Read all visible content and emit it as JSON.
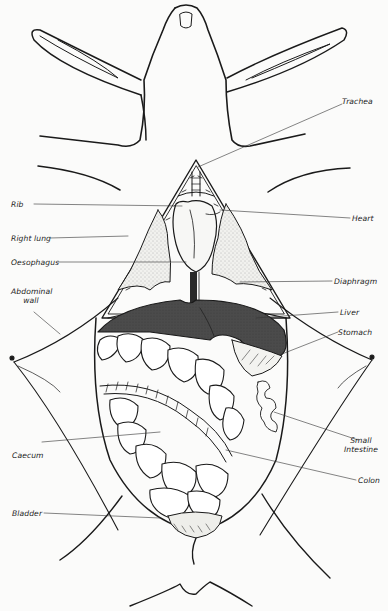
{
  "figure": {
    "colors": {
      "ink": "#1a1a1a",
      "background": "#fbfbfa",
      "liver": "#4a4a4a",
      "lung_fill": "#e6e6e2",
      "oesophagus": "#2a2a2a"
    }
  },
  "labels": {
    "left": [
      {
        "id": "rib",
        "text": "Rib"
      },
      {
        "id": "right_lung",
        "text": "Right lung"
      },
      {
        "id": "oesophagus",
        "text": "Oesophagus"
      },
      {
        "id": "abdominal_wall_1",
        "text": "Abdominal"
      },
      {
        "id": "abdominal_wall_2",
        "text": "wall"
      },
      {
        "id": "caecum",
        "text": "Caecum"
      },
      {
        "id": "bladder",
        "text": "Bladder"
      }
    ],
    "right": [
      {
        "id": "trachea",
        "text": "Trachea"
      },
      {
        "id": "heart",
        "text": "Heart"
      },
      {
        "id": "diaphragm",
        "text": "Diaphragm"
      },
      {
        "id": "liver",
        "text": "Liver"
      },
      {
        "id": "stomach",
        "text": "Stomach"
      },
      {
        "id": "small_intestine_1",
        "text": "Small"
      },
      {
        "id": "small_intestine_2",
        "text": "Intestine"
      },
      {
        "id": "colon",
        "text": "Colon"
      }
    ]
  }
}
